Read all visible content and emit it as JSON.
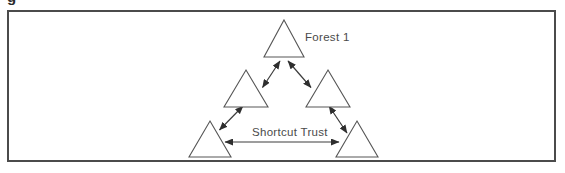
{
  "figure": {
    "caption_fragment": "g",
    "diagram": {
      "forest_label": "Forest 1",
      "shortcut_trust_label": "Shortcut Trust"
    },
    "colors": {
      "background": "#ffffff",
      "frame_border": "#4b4b4b",
      "shape_outline": "#565656",
      "shape_fill": "#ffffff",
      "trust_line": "#3c3c3c",
      "arrowhead": "#2e2e2e",
      "text": "#4a4a4a"
    }
  }
}
